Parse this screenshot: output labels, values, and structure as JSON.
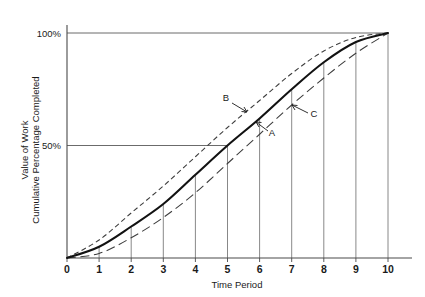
{
  "chart_data": {
    "type": "line",
    "title": "",
    "subtitle": "",
    "xlabel": "Time Period",
    "ylabel_line1": "Value of Work",
    "ylabel_line2": "Cumulative Percentage Completed",
    "xlim": [
      0,
      10
    ],
    "ylim": [
      0,
      100
    ],
    "grid": "horizontal gridlines at 50% and 100% only; vertical drop lines from curve A down to x-axis at each integer period",
    "legend_position": "inline annotations with leader arrows",
    "x_tick_labels": [
      "0",
      "1",
      "2",
      "3",
      "4",
      "5",
      "6",
      "7",
      "8",
      "9",
      "10"
    ],
    "x": [
      0,
      1,
      2,
      3,
      4,
      5,
      6,
      7,
      8,
      9,
      10
    ],
    "y_tick_labels": [
      "50%",
      "100%"
    ],
    "y_tick_values": [
      50,
      100
    ],
    "series": [
      {
        "name": "A",
        "style": "solid-heavy",
        "description": "planned S-curve (baseline)",
        "values": [
          0,
          5,
          14,
          24,
          37,
          50,
          62,
          75,
          87,
          96,
          100
        ]
      },
      {
        "name": "B",
        "style": "dashed-short",
        "description": "optimistic / ahead-of-schedule envelope",
        "values": [
          0,
          8,
          20,
          32,
          45,
          58,
          70,
          82,
          92,
          98,
          100
        ]
      },
      {
        "name": "C",
        "style": "dashed-long",
        "description": "pessimistic / behind-schedule envelope",
        "values": [
          0,
          2,
          9,
          18,
          29,
          42,
          55,
          68,
          80,
          91,
          100
        ]
      }
    ],
    "annotations": [
      {
        "label": "B",
        "points_to_series": "B",
        "at_x": 5.6
      },
      {
        "label": "A",
        "points_to_series": "A",
        "at_x": 6.1
      },
      {
        "label": "C",
        "points_to_series": "C",
        "at_x": 6.9
      }
    ]
  }
}
